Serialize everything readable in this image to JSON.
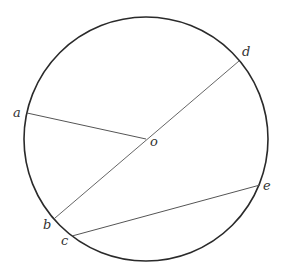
{
  "diagram": {
    "type": "circle-geometry",
    "circle": {
      "cx": 146,
      "cy": 139,
      "r": 122,
      "stroke": "#2a2a2a"
    },
    "points": {
      "a": {
        "x": 27,
        "y": 113,
        "label": "a"
      },
      "o": {
        "x": 146,
        "y": 139,
        "label": "o"
      },
      "d": {
        "x": 239,
        "y": 61,
        "label": "d"
      },
      "b": {
        "x": 55,
        "y": 218,
        "label": "b"
      },
      "c": {
        "x": 72,
        "y": 236,
        "label": "c"
      },
      "e": {
        "x": 260,
        "y": 185,
        "label": "e"
      }
    },
    "segments": [
      {
        "from": "a",
        "to": "o",
        "name": "radius-ao"
      },
      {
        "from": "b",
        "to": "d",
        "name": "diameter-bd"
      },
      {
        "from": "c",
        "to": "e",
        "name": "chord-ce"
      }
    ],
    "line_color": "#555555"
  }
}
